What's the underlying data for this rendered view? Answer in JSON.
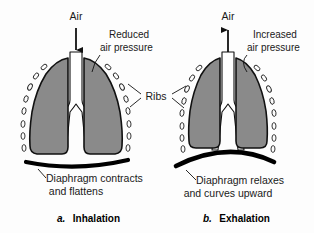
{
  "figure": {
    "background_color": "#fdfdfd"
  },
  "colors": {
    "lung_fill": "#8a8a8a",
    "outline": "#111111",
    "diaphragm": "#000000",
    "text": "#1a1a1a",
    "rib_stroke": "#222222",
    "airway_fill": "#ffffff"
  },
  "panels": [
    {
      "id": "inhalation",
      "caption_marker": "a.",
      "caption_text": "Inhalation",
      "air_label": "Air",
      "air_direction": "down",
      "pressure_label_line1": "Reduced",
      "pressure_label_line2": "air pressure",
      "diaphragm_label_line1": "Diaphragm contracts",
      "diaphragm_label_line2": "and flattens",
      "diaphragm_state": "flattened",
      "rib_count": 16
    },
    {
      "id": "exhalation",
      "caption_marker": "b.",
      "caption_text": "Exhalation",
      "air_label": "Air",
      "air_direction": "up",
      "pressure_label_line1": "Increased",
      "pressure_label_line2": "air pressure",
      "diaphragm_label_line1": "Diaphragm relaxes",
      "diaphragm_label_line2": "and curves upward",
      "diaphragm_state": "domed",
      "rib_count": 16
    }
  ],
  "shared_labels": {
    "ribs": "Ribs"
  }
}
